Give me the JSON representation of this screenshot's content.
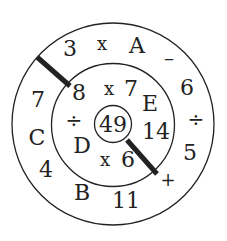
{
  "puzzle": {
    "center": "49",
    "middle_ring": [
      {
        "id": "m1",
        "text": "8",
        "x": 79,
        "y": 100,
        "size": 22
      },
      {
        "id": "m2",
        "text": "x",
        "x": 109,
        "y": 95,
        "size": 18
      },
      {
        "id": "m3",
        "text": "7",
        "x": 131,
        "y": 96,
        "size": 22
      },
      {
        "id": "m4",
        "text": "E",
        "x": 150,
        "y": 111,
        "size": 22
      },
      {
        "id": "m5",
        "text": "14",
        "x": 156,
        "y": 139,
        "size": 22
      },
      {
        "id": "m6",
        "text": "6",
        "x": 128,
        "y": 167,
        "size": 22
      },
      {
        "id": "m7",
        "text": "x",
        "x": 105,
        "y": 166,
        "size": 18
      },
      {
        "id": "m8",
        "text": "D",
        "x": 82,
        "y": 153,
        "size": 22
      },
      {
        "id": "m9",
        "text": "÷",
        "x": 74,
        "y": 127,
        "size": 20
      }
    ],
    "outer_ring": [
      {
        "id": "o1",
        "text": "3",
        "x": 70,
        "y": 56,
        "size": 22
      },
      {
        "id": "o2",
        "text": "x",
        "x": 102,
        "y": 50,
        "size": 18
      },
      {
        "id": "o3",
        "text": "A",
        "x": 137,
        "y": 53,
        "size": 22
      },
      {
        "id": "o4",
        "text": "–",
        "x": 169,
        "y": 65,
        "size": 20
      },
      {
        "id": "o5",
        "text": "6",
        "x": 187,
        "y": 95,
        "size": 22
      },
      {
        "id": "o6",
        "text": "÷",
        "x": 196,
        "y": 126,
        "size": 20
      },
      {
        "id": "o7",
        "text": "5",
        "x": 190,
        "y": 160,
        "size": 22
      },
      {
        "id": "o8",
        "text": "+",
        "x": 168,
        "y": 186,
        "size": 18
      },
      {
        "id": "o9",
        "text": "11",
        "x": 126,
        "y": 208,
        "size": 22
      },
      {
        "id": "o10",
        "text": "B",
        "x": 82,
        "y": 200,
        "size": 22
      },
      {
        "id": "o11",
        "text": "4",
        "x": 46,
        "y": 177,
        "size": 22
      },
      {
        "id": "o12",
        "text": "C",
        "x": 37,
        "y": 145,
        "size": 22
      },
      {
        "id": "o13",
        "text": "7",
        "x": 38,
        "y": 107,
        "size": 22
      }
    ],
    "colors": {
      "stroke": "#222222",
      "background": "#ffffff"
    }
  }
}
